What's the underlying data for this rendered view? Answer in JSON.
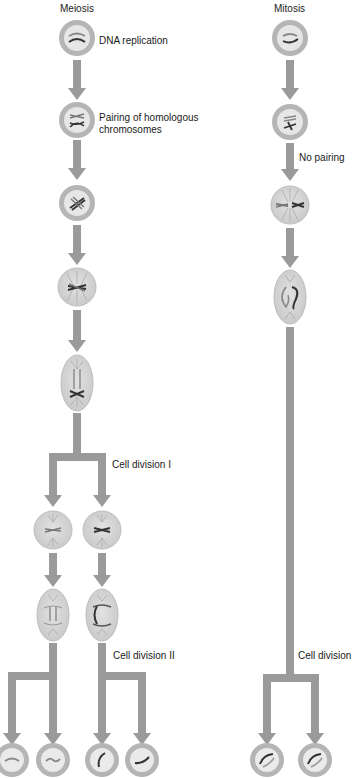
{
  "headers": {
    "meiosis": "Meiosis",
    "mitosis": "Mitosis"
  },
  "labels": {
    "dna_replication": "DNA replication",
    "pairing_line1": "Pairing of homologous",
    "pairing_line2": "chromosomes",
    "no_pairing": "No pairing",
    "cell_division_1": "Cell division I",
    "cell_division_2": "Cell division II",
    "cell_division": "Cell division"
  },
  "colors": {
    "arrow": "#9a9a9a",
    "cell_ring": "#b5b5b5",
    "cell_fill": "#d4d4d4",
    "chromosome": "#3a3a3a",
    "text": "#1a1a1a"
  },
  "meiosis_stages": [
    "interphase",
    "replicated",
    "paired-homologs",
    "metaphase-I",
    "anaphase-I",
    "metaphase-II",
    "anaphase-II",
    "gametes"
  ],
  "mitosis_stages": [
    "interphase",
    "replicated",
    "metaphase",
    "anaphase",
    "daughter-cells"
  ]
}
